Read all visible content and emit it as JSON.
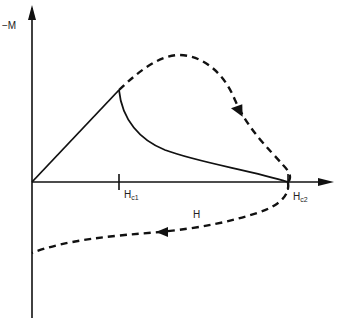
{
  "figure": {
    "type": "magnetization-curve-diagram",
    "axes": {
      "y_label": "−M",
      "x_label": "H"
    },
    "tick_labels": {
      "hc1": {
        "main": "H",
        "sub": "c1"
      },
      "hc2": {
        "main": "H",
        "sub": "c2"
      }
    },
    "curves": [
      {
        "name": "linear-rise",
        "style": "solid",
        "description": "from origin rising linearly to peak at Hc1"
      },
      {
        "name": "decay-to-hc2",
        "style": "solid",
        "description": "from peak decaying to zero at Hc2"
      },
      {
        "name": "upper-loop",
        "style": "dashed",
        "description": "dashed curve arching above, arrow pointing down toward Hc2"
      },
      {
        "name": "lower-return",
        "style": "dashed",
        "description": "dashed curve below axis returning leftward to M axis, arrow pointing left"
      }
    ],
    "colors": {
      "line": "#111111",
      "background": "#ffffff"
    }
  }
}
